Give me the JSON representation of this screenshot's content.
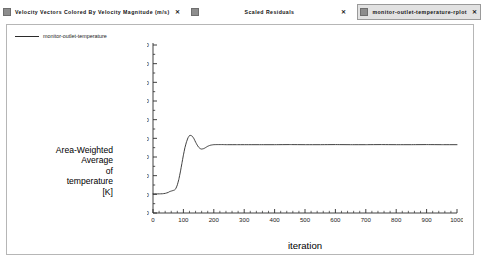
{
  "window": {
    "background": "#ffffff",
    "panel_border": "#b6b6b6"
  },
  "tabs": [
    {
      "label": "Velocity Vectors Colored By Velocity Magnitude (m/s)",
      "icon": "document-icon",
      "close": "✕",
      "active": false
    },
    {
      "label": "Scaled Residuals",
      "icon": "document-icon",
      "close": "✕",
      "active": false
    },
    {
      "label": "monitor-outlet-temperature-rplot",
      "icon": "document-icon",
      "close": "✕",
      "active": true
    }
  ],
  "legend": {
    "entries": [
      {
        "label": "monitor-outlet-temperature",
        "color": "#2b2b2b"
      }
    ]
  },
  "axis_title": {
    "y_lines": [
      "Area-Weighted",
      "Average",
      "of",
      "temperature",
      "[K]"
    ],
    "x": "iteration"
  },
  "chart_data": {
    "type": "line",
    "title": "",
    "xlabel": "iteration",
    "ylabel": "Area-Weighted Average of temperature [K]",
    "xlim": [
      0,
      1000
    ],
    "ylim": [
      296.0,
      314.0
    ],
    "xticks": [
      0,
      100,
      200,
      300,
      400,
      500,
      600,
      700,
      800,
      900,
      1000
    ],
    "yticks": [
      296.0,
      298.0,
      300.0,
      302.0,
      304.0,
      306.0,
      308.0,
      310.0,
      312.0,
      314.0
    ],
    "ytick_labels": [
      "296.0000",
      "298.0000",
      "300.0000",
      "302.0000",
      "304.0000",
      "306.0000",
      "308.0000",
      "310.0000",
      "312.0000",
      "314.0000"
    ],
    "xtick_labels": [
      "0",
      "100",
      "200",
      "300",
      "400",
      "500",
      "600",
      "700",
      "800",
      "900",
      "1000"
    ],
    "grid": false,
    "minor_ticks": true,
    "legend_position": "top-left-outside",
    "series": [
      {
        "name": "monitor-outlet-temperature",
        "color": "#2b2b2b",
        "x": [
          0,
          10,
          20,
          30,
          40,
          50,
          55,
          60,
          65,
          70,
          75,
          80,
          85,
          90,
          95,
          100,
          105,
          110,
          115,
          120,
          125,
          130,
          135,
          140,
          145,
          150,
          155,
          160,
          165,
          170,
          175,
          180,
          185,
          190,
          195,
          200,
          210,
          220,
          230,
          240,
          250,
          275,
          300,
          350,
          400,
          450,
          500,
          550,
          600,
          650,
          700,
          750,
          800,
          850,
          900,
          950,
          1000
        ],
        "y": [
          298.05,
          298.05,
          298.05,
          298.06,
          298.1,
          298.2,
          298.3,
          298.35,
          298.4,
          298.45,
          298.6,
          299.0,
          299.6,
          300.4,
          301.3,
          302.2,
          303.0,
          303.6,
          304.05,
          304.3,
          304.32,
          304.2,
          303.95,
          303.6,
          303.3,
          303.05,
          302.9,
          302.85,
          302.88,
          302.95,
          303.05,
          303.15,
          303.22,
          303.27,
          303.3,
          303.32,
          303.33,
          303.33,
          303.33,
          303.32,
          303.32,
          303.32,
          303.32,
          303.32,
          303.32,
          303.33,
          303.32,
          303.32,
          303.33,
          303.32,
          303.32,
          303.33,
          303.32,
          303.32,
          303.33,
          303.32,
          303.32
        ]
      }
    ]
  }
}
